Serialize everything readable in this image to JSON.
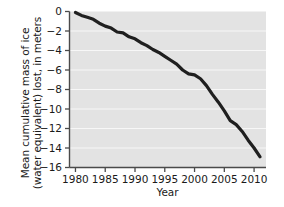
{
  "chart_data": {
    "type": "line",
    "title": "",
    "subtitle": "",
    "xlabel": "Year",
    "ylabel_line1": "Mean cumulative mass of ice",
    "ylabel_line2": "(water equivalent) lost, in meters",
    "ylabel": "Mean cumulative mass of ice (water equivalent) lost, in meters",
    "xlim": [
      1979,
      2012
    ],
    "ylim": [
      -16,
      0
    ],
    "xticks": [
      1980,
      1985,
      1990,
      1995,
      2000,
      2005,
      2010
    ],
    "xticklabels": [
      "1980",
      "1985",
      "1990",
      "1995",
      "2000",
      "2005",
      "2010"
    ],
    "yticks": [
      0,
      -2,
      -4,
      -6,
      -8,
      -10,
      -12,
      -14,
      -16
    ],
    "yticklabels": [
      "0",
      "−2",
      "−4",
      "−6",
      "−8",
      "−10",
      "−12",
      "−14",
      "−16"
    ],
    "grid": "horizontal-white-gridlines",
    "legend": "none",
    "plot_background": "#e3e3e3",
    "gridline_color": "#f7f7f7",
    "line_color": "#1f1f1f",
    "line_width_px": 3.2,
    "series": [
      {
        "name": "Mean cumulative mass balance",
        "x": [
          1980,
          1981,
          1982,
          1983,
          1984,
          1985,
          1986,
          1987,
          1988,
          1989,
          1990,
          1991,
          1992,
          1993,
          1994,
          1995,
          1996,
          1997,
          1998,
          1999,
          2000,
          2001,
          2002,
          2003,
          2004,
          2005,
          2006,
          2007,
          2008,
          2009,
          2010,
          2011
        ],
        "values": [
          -0.1,
          -0.4,
          -0.6,
          -0.8,
          -1.2,
          -1.5,
          -1.7,
          -2.1,
          -2.2,
          -2.6,
          -2.8,
          -3.2,
          -3.5,
          -3.9,
          -4.2,
          -4.6,
          -5.0,
          -5.4,
          -6.0,
          -6.4,
          -6.5,
          -6.9,
          -7.6,
          -8.5,
          -9.3,
          -10.2,
          -11.2,
          -11.6,
          -12.3,
          -13.2,
          -14.0,
          -14.9
        ]
      }
    ],
    "annotations": []
  }
}
